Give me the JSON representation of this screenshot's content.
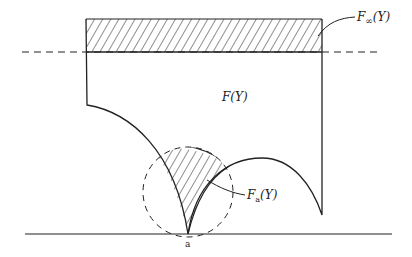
{
  "diagram": {
    "labels": {
      "f_infinity": "F∞(Y)",
      "f_infinity_main": "F",
      "f_infinity_sub": "∞",
      "f_infinity_arg": "(Y)",
      "f_main": "F(Y)",
      "f_a_main": "F",
      "f_a_sub": "a",
      "f_a_arg": "(Y)",
      "point_a": "a"
    },
    "colors": {
      "stroke": "#222222",
      "background": "#ffffff"
    },
    "regions": [
      {
        "name": "F-infinity region",
        "hatched": true
      },
      {
        "name": "F(Y) region",
        "hatched": false
      },
      {
        "name": "F_a(Y) region",
        "hatched": true
      }
    ]
  }
}
